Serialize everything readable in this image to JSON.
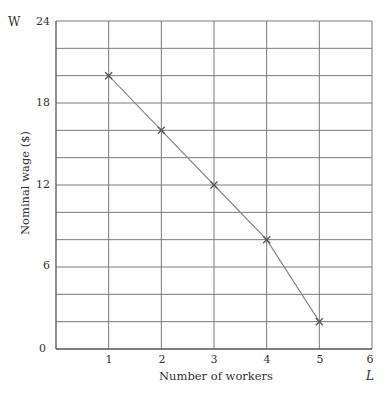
{
  "chart_data": {
    "type": "line",
    "title": "",
    "xlabel": "Number of workers",
    "ylabel": "Nominal wage ($)",
    "x_axis_symbol": "L",
    "y_axis_symbol": "W",
    "xlim": [
      0,
      6
    ],
    "ylim": [
      0,
      24
    ],
    "x_ticks": [
      0,
      1,
      2,
      3,
      4,
      5,
      6
    ],
    "y_ticks": [
      6,
      12,
      18,
      24
    ],
    "y_grid_step": 2,
    "x_grid_step": 1,
    "grid": true,
    "legend": null,
    "series": [
      {
        "name": "Nominal wage",
        "marker": "x",
        "color": "#888888",
        "marker_color": "#555555",
        "x": [
          1,
          2,
          3,
          4,
          5
        ],
        "y": [
          20,
          16,
          12,
          8,
          2
        ]
      }
    ]
  },
  "labels": {
    "origin": "0",
    "x_tick_labels": [
      "1",
      "2",
      "3",
      "4",
      "5",
      "6"
    ],
    "y_tick_labels": [
      "6",
      "12",
      "18",
      "24"
    ],
    "x_axis_title": "Number of workers",
    "y_axis_title": "Nominal wage ($)",
    "x_symbol": "L",
    "y_symbol": "W"
  },
  "colors": {
    "grid": "#7a7a7a",
    "axis": "#555555",
    "line": "#8a8a8a",
    "marker": "#555555",
    "text": "#333333"
  }
}
